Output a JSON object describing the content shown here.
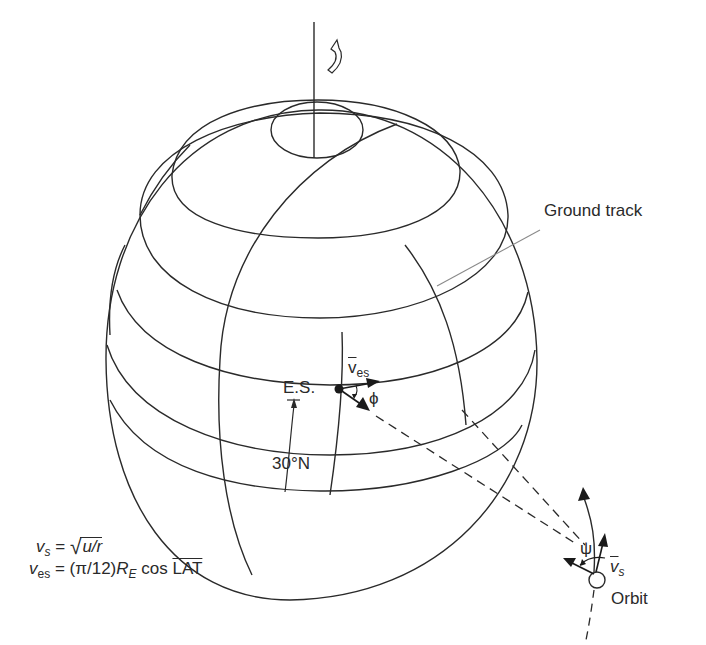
{
  "figure": {
    "type": "satellite ground track over rotating Earth",
    "labels": {
      "ground_track": "Ground track",
      "earth_station": "E.S.",
      "latitude": "30°N",
      "earth_station_velocity": "v",
      "earth_station_velocity_sub": "es",
      "angle_phi": "ϕ",
      "angle_psi": "ψ",
      "satellite_velocity": "v",
      "satellite_velocity_sub": "s",
      "orbit": "Orbit"
    },
    "equations": {
      "eq1": {
        "lhs_var": "v",
        "lhs_sub": "s",
        "equals": " = ",
        "radical": "√",
        "radicand": "u/r"
      },
      "eq2": {
        "lhs_var": "v",
        "lhs_sub": "es",
        "equals": " = ",
        "factor": "(π/12)",
        "radius_var": "R",
        "radius_sub": "E",
        "func": " cos ",
        "arg": "LAT"
      }
    },
    "colors": {
      "line": "#2a2a2a",
      "leader": "#8a8a8a",
      "background": "#ffffff"
    }
  }
}
